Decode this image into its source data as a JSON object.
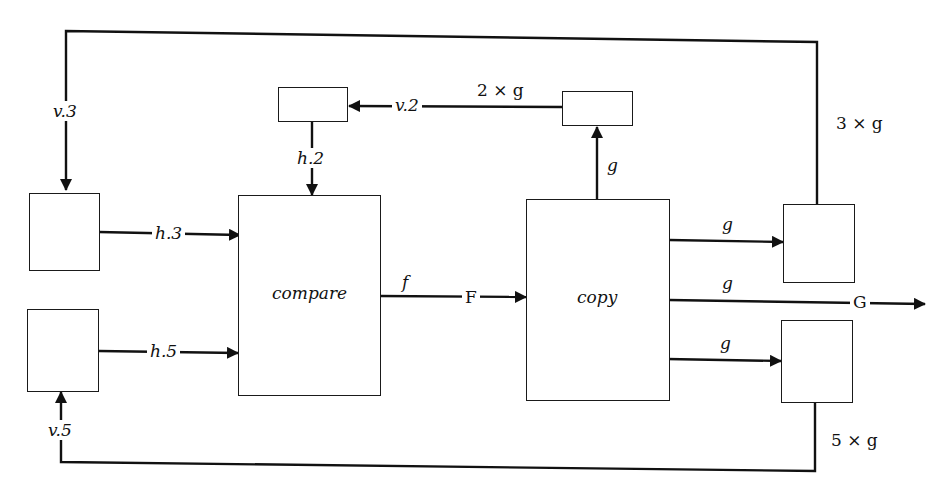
{
  "diagram": {
    "type": "dataflow",
    "nodes": {
      "compare": {
        "label": "compare"
      },
      "copy": {
        "label": "copy"
      }
    },
    "edge_labels": {
      "v3": "v.3",
      "v2": "v.2",
      "two_g": "2 × g",
      "h2": "h.2",
      "g_up": "g",
      "three_g": "3 × g",
      "h3": "h.3",
      "g_top_right": "g",
      "f": "f",
      "F": "F",
      "g_mid": "g",
      "G": "G",
      "h5": "h.5",
      "g_bottom_right": "g",
      "v5": "v.5",
      "five_g": "5 × g"
    }
  }
}
